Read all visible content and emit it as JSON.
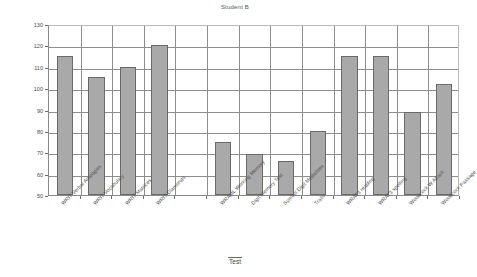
{
  "chart_data": {
    "type": "bar",
    "title": "Student B",
    "xlabel": "Test",
    "ylabel": "",
    "ylim": [
      50,
      130
    ],
    "ytick_step": 10,
    "yticks": [
      50,
      60,
      70,
      80,
      90,
      100,
      110,
      120,
      130
    ],
    "grid": true,
    "legend": false,
    "bar_color": "#a9a9a9",
    "bar_edge_color": "#6a6a6a",
    "categories": [
      "WRIT Verbal Analogies",
      "WRIT Vocabulary",
      "WRIT Matrices",
      "WRIT Diamonds",
      "",
      "WRAML Working Memory",
      "Digit Memory Test",
      "Symbol Digit Modalities",
      "Trails",
      "WRAT3 reading",
      "WRAT3 spelling",
      "Woodcock W Attack",
      "Woodcock Passage"
    ],
    "values": [
      115,
      105,
      110,
      120,
      null,
      75,
      69,
      66,
      80,
      115,
      115,
      89,
      102
    ]
  },
  "axis": {
    "y_tick_labels": [
      "130",
      "120",
      "110",
      "100",
      "90",
      "80",
      "70",
      "60",
      "50"
    ],
    "x_title": "Test"
  }
}
